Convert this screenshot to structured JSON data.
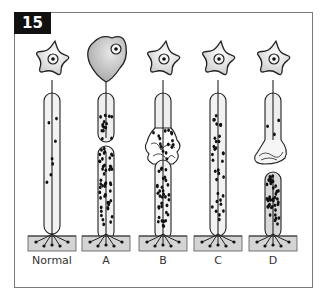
{
  "figure": {
    "number": "15",
    "colors": {
      "cell_fill": "#ececec",
      "cell_fill_degenerated": "#c8c8c8",
      "muscle_fill": "#d4d4d4",
      "outline": "#222222",
      "frame": "#7a7a7a"
    },
    "columns": [
      {
        "id": "normal",
        "label": "Normal",
        "cell": "star",
        "sheath": "intact",
        "particle_density": "sparse"
      },
      {
        "id": "a",
        "label": "A",
        "cell": "rounded-degenerated",
        "sheath": "interrupted",
        "particle_density": "dense"
      },
      {
        "id": "b",
        "label": "B",
        "cell": "star",
        "sheath": "segmental-swelling",
        "particle_density": "dense"
      },
      {
        "id": "c",
        "label": "C",
        "cell": "star",
        "sheath": "intact",
        "particle_density": "moderate"
      },
      {
        "id": "d",
        "label": "D",
        "cell": "star",
        "sheath": "retracted-bulb",
        "particle_density": "dense"
      }
    ]
  }
}
